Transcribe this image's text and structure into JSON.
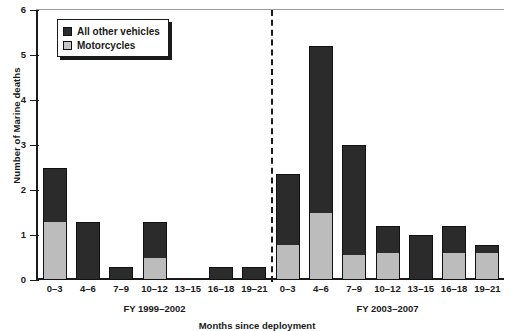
{
  "chart_data": {
    "type": "bar",
    "subtype": "stacked-bar",
    "title": "",
    "xlabel": "Months since deployment",
    "ylabel": "Number of Marine deaths",
    "ylim": [
      0,
      6
    ],
    "yticks": [
      0,
      1,
      2,
      3,
      4,
      5,
      6
    ],
    "grid": false,
    "legend_position": "top-left",
    "categories": [
      "0–3",
      "4–6",
      "7–9",
      "10–12",
      "13–15",
      "16–18",
      "19–21"
    ],
    "panels": [
      {
        "label": "FY 1999–2002",
        "series": [
          {
            "name": "Motorcycles",
            "values": [
              1.3,
              0.0,
              0.0,
              0.5,
              0.0,
              0.0,
              0.0
            ]
          },
          {
            "name": "All other vehicles",
            "values": [
              1.2,
              1.3,
              0.3,
              0.8,
              0.0,
              0.3,
              0.3
            ]
          }
        ],
        "totals": [
          2.5,
          1.3,
          0.3,
          1.3,
          0.0,
          0.3,
          0.3
        ]
      },
      {
        "label": "FY 2003–2007",
        "series": [
          {
            "name": "Motorcycles",
            "values": [
              0.78,
              1.5,
              0.56,
              0.6,
              0.0,
              0.6,
              0.6
            ]
          },
          {
            "name": "All other vehicles",
            "values": [
              1.58,
              3.7,
              2.44,
              0.6,
              1.0,
              0.6,
              0.18
            ]
          }
        ],
        "totals": [
          2.36,
          5.2,
          3.0,
          1.2,
          1.0,
          1.2,
          0.78
        ]
      }
    ],
    "legend": [
      {
        "label": "All other vehicles",
        "color": "#2b2b2b"
      },
      {
        "label": "Motorcycles",
        "color": "#bcbcbc"
      }
    ],
    "colors": {
      "all_other_vehicles": "#2b2b2b",
      "motorcycles": "#bcbcbc",
      "axis": "#1a1a1a"
    }
  }
}
